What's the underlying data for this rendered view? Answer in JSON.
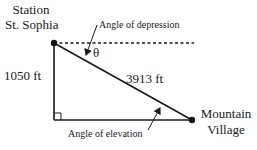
{
  "diagram": {
    "type": "right-triangle",
    "points": {
      "top": {
        "name_line1": "Station",
        "name_line2": "St. Sophia"
      },
      "right": {
        "name_line1": "Mountain",
        "name_line2": "Village"
      }
    },
    "labels": {
      "vertical_side": "1050 ft",
      "hypotenuse": "3913 ft",
      "angle_depression": "Angle of depression",
      "angle_elevation": "Angle of elevation",
      "theta": "θ"
    },
    "colors": {
      "line": "#1a1a1a",
      "background": "#ffffff"
    }
  }
}
